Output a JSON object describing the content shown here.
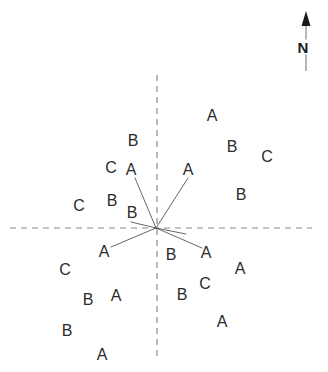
{
  "figure": {
    "type": "scatter-diagram",
    "background_color": "#ffffff",
    "width": 328,
    "height": 372
  },
  "north_indicator": {
    "label": "N",
    "icon": "north-arrow-icon",
    "label_x": 303,
    "label_y": 47,
    "arrow_x": 306,
    "arrow_tip_y": 11,
    "arrow_tail_y": 71,
    "color": "#1a1a1a"
  },
  "axes": {
    "color": "#8a8a8a",
    "dash": "6,5",
    "horizontal": {
      "x1": 10,
      "y1": 228,
      "x2": 312,
      "y2": 228
    },
    "vertical": {
      "x1": 157,
      "y1": 75,
      "x2": 157,
      "y2": 356
    }
  },
  "origin": {
    "x": 156,
    "y": 228,
    "label": "origin-vertex"
  },
  "rays": {
    "color": "#555555",
    "width": 0.9,
    "segments": [
      {
        "name": "ray-upper-left",
        "x1": 156,
        "y1": 228,
        "x2": 135,
        "y2": 178
      },
      {
        "name": "ray-upper-right",
        "x1": 156,
        "y1": 228,
        "x2": 188,
        "y2": 178
      },
      {
        "name": "ray-lower-left",
        "x1": 156,
        "y1": 228,
        "x2": 111,
        "y2": 247
      },
      {
        "name": "ray-lower-right",
        "x1": 156,
        "y1": 228,
        "x2": 202,
        "y2": 248
      },
      {
        "name": "ray-west-stub",
        "x1": 156,
        "y1": 228,
        "x2": 131,
        "y2": 222
      },
      {
        "name": "ray-east-stub",
        "x1": 156,
        "y1": 228,
        "x2": 186,
        "y2": 234
      }
    ]
  },
  "chart_data": {
    "type": "scatter",
    "title": "",
    "xlabel": "",
    "ylabel": "",
    "grid": false,
    "legend": "none",
    "categories": [
      "A",
      "B",
      "C"
    ],
    "quadrants": [
      "upper-left",
      "upper-right",
      "lower-left",
      "lower-right"
    ],
    "points": [
      {
        "label": "B",
        "x": 133,
        "y": 141,
        "quadrant": "upper-left"
      },
      {
        "label": "C",
        "x": 111,
        "y": 168,
        "quadrant": "upper-left"
      },
      {
        "label": "A",
        "x": 131,
        "y": 170,
        "quadrant": "upper-left"
      },
      {
        "label": "B",
        "x": 112,
        "y": 201,
        "quadrant": "upper-left"
      },
      {
        "label": "C",
        "x": 79,
        "y": 206,
        "quadrant": "upper-left"
      },
      {
        "label": "B",
        "x": 132,
        "y": 213,
        "quadrant": "upper-left"
      },
      {
        "label": "A",
        "x": 212,
        "y": 116,
        "quadrant": "upper-right"
      },
      {
        "label": "B",
        "x": 232,
        "y": 147,
        "quadrant": "upper-right"
      },
      {
        "label": "C",
        "x": 267,
        "y": 157,
        "quadrant": "upper-right"
      },
      {
        "label": "A",
        "x": 188,
        "y": 170,
        "quadrant": "upper-right"
      },
      {
        "label": "B",
        "x": 241,
        "y": 195,
        "quadrant": "upper-right"
      },
      {
        "label": "A",
        "x": 104,
        "y": 252,
        "quadrant": "lower-left"
      },
      {
        "label": "C",
        "x": 65,
        "y": 270,
        "quadrant": "lower-left"
      },
      {
        "label": "A",
        "x": 116,
        "y": 296,
        "quadrant": "lower-left"
      },
      {
        "label": "B",
        "x": 88,
        "y": 300,
        "quadrant": "lower-left"
      },
      {
        "label": "B",
        "x": 67,
        "y": 331,
        "quadrant": "lower-left"
      },
      {
        "label": "A",
        "x": 102,
        "y": 355,
        "quadrant": "lower-left"
      },
      {
        "label": "B",
        "x": 171,
        "y": 255,
        "quadrant": "lower-right"
      },
      {
        "label": "A",
        "x": 206,
        "y": 253,
        "quadrant": "lower-right"
      },
      {
        "label": "A",
        "x": 240,
        "y": 269,
        "quadrant": "lower-right"
      },
      {
        "label": "C",
        "x": 205,
        "y": 284,
        "quadrant": "lower-right"
      },
      {
        "label": "B",
        "x": 182,
        "y": 295,
        "quadrant": "lower-right"
      },
      {
        "label": "A",
        "x": 222,
        "y": 322,
        "quadrant": "lower-right"
      }
    ]
  }
}
